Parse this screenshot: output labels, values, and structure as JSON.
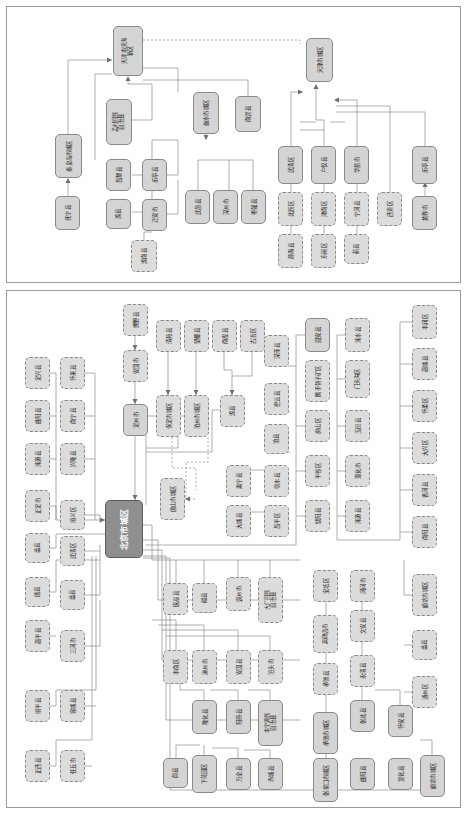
{
  "diagram": {
    "type": "hierarchy-flowchart",
    "orientation": "text-rotated-90deg",
    "panels": [
      {
        "id": "panel-top",
        "name": "tianjin-qinhuangdao-panel"
      },
      {
        "id": "panel-bottom",
        "name": "beijing-hebei-panel"
      }
    ],
    "legend": {
      "solid_node": "地级市/市辖区节点",
      "dashed_node": "县级节点",
      "root_node": "核心城区节点"
    },
    "colors": {
      "node_fill": "#d9d9d9",
      "node_border": "#8a8a8a",
      "root_fill": "#8f8f8f",
      "root_text": "#ffffff",
      "wire": "#8d8d8d",
      "panel_border": "#9a9a9a"
    }
  },
  "nodes_top": [
    {
      "id": "t1",
      "label": "天津市滨海新区",
      "style": "solid",
      "x": 113,
      "y": 26,
      "w": 30,
      "h": 50
    },
    {
      "id": "t2",
      "label": "天津市城区",
      "style": "solid",
      "x": 306,
      "y": 38,
      "w": 27,
      "h": 44
    },
    {
      "id": "t3",
      "label": "秦皇岛市城区",
      "style": "solid",
      "x": 55,
      "y": 134,
      "w": 27,
      "h": 44
    },
    {
      "id": "t4",
      "label": "抚宁县",
      "style": "solid",
      "x": 55,
      "y": 196,
      "w": 25,
      "h": 34
    },
    {
      "id": "t5",
      "label": "孟村回族自治县",
      "style": "solid",
      "x": 106,
      "y": 99,
      "w": 26,
      "h": 46
    },
    {
      "id": "t6",
      "label": "昌黎县",
      "style": "solid",
      "x": 106,
      "y": 159,
      "w": 25,
      "h": 32
    },
    {
      "id": "t7",
      "label": "滦县",
      "style": "solid",
      "x": 106,
      "y": 199,
      "w": 25,
      "h": 30
    },
    {
      "id": "t8",
      "label": "乐亭县",
      "style": "solid",
      "x": 142,
      "y": 159,
      "w": 25,
      "h": 32
    },
    {
      "id": "t9",
      "label": "迁安市",
      "style": "solid",
      "x": 142,
      "y": 199,
      "w": 25,
      "h": 32
    },
    {
      "id": "t10",
      "label": "滦南县",
      "style": "dashed",
      "x": 131,
      "y": 240,
      "w": 26,
      "h": 32
    },
    {
      "id": "t11",
      "label": "衡水市城区",
      "style": "solid",
      "x": 193,
      "y": 92,
      "w": 26,
      "h": 42
    },
    {
      "id": "t12",
      "label": "南宫县",
      "style": "solid",
      "x": 235,
      "y": 96,
      "w": 26,
      "h": 36
    },
    {
      "id": "t13",
      "label": "武邑县",
      "style": "solid",
      "x": 185,
      "y": 190,
      "w": 25,
      "h": 34
    },
    {
      "id": "t14",
      "label": "深州市",
      "style": "solid",
      "x": 213,
      "y": 190,
      "w": 25,
      "h": 34
    },
    {
      "id": "t15",
      "label": "枣强县",
      "style": "solid",
      "x": 241,
      "y": 190,
      "w": 25,
      "h": 34
    },
    {
      "id": "t16",
      "label": "武清区",
      "style": "solid",
      "x": 278,
      "y": 146,
      "w": 25,
      "h": 38
    },
    {
      "id": "t17",
      "label": "北辰区",
      "style": "dashed",
      "x": 278,
      "y": 192,
      "w": 25,
      "h": 34
    },
    {
      "id": "t18",
      "label": "静海县",
      "style": "dashed",
      "x": 278,
      "y": 234,
      "w": 25,
      "h": 34
    },
    {
      "id": "t19",
      "label": "户仅县",
      "style": "solid",
      "x": 311,
      "y": 146,
      "w": 25,
      "h": 38
    },
    {
      "id": "t20",
      "label": "津南区",
      "style": "dashed",
      "x": 311,
      "y": 192,
      "w": 25,
      "h": 34
    },
    {
      "id": "t21",
      "label": "东丽区",
      "style": "dashed",
      "x": 311,
      "y": 234,
      "w": 25,
      "h": 34
    },
    {
      "id": "t22",
      "label": "华苗市",
      "style": "solid",
      "x": 344,
      "y": 146,
      "w": 25,
      "h": 38
    },
    {
      "id": "t23",
      "label": "宁河县",
      "style": "dashed",
      "x": 344,
      "y": 192,
      "w": 25,
      "h": 34
    },
    {
      "id": "t24",
      "label": "蓟县",
      "style": "dashed",
      "x": 344,
      "y": 234,
      "w": 25,
      "h": 30
    },
    {
      "id": "t25",
      "label": "西青区",
      "style": "dashed",
      "x": 377,
      "y": 192,
      "w": 25,
      "h": 34
    },
    {
      "id": "t26",
      "label": "乐亭县",
      "style": "solid",
      "x": 412,
      "y": 146,
      "w": 25,
      "h": 38
    },
    {
      "id": "t27",
      "label": "黄骅市",
      "style": "solid",
      "x": 412,
      "y": 196,
      "w": 25,
      "h": 34
    }
  ],
  "nodes_bottom": [
    {
      "id": "b0",
      "label": "北京市城区",
      "style": "root",
      "x": 105,
      "y": 500,
      "w": 38,
      "h": 58
    },
    {
      "id": "b1",
      "label": "博野县",
      "style": "dashed",
      "x": 123,
      "y": 304,
      "w": 25,
      "h": 32
    },
    {
      "id": "b2",
      "label": "安国市",
      "style": "dashed",
      "x": 123,
      "y": 350,
      "w": 25,
      "h": 32
    },
    {
      "id": "b3",
      "label": "定州市",
      "style": "solid",
      "x": 123,
      "y": 404,
      "w": 25,
      "h": 32
    },
    {
      "id": "b4",
      "label": "清苑县",
      "style": "dashed",
      "x": 156,
      "y": 320,
      "w": 25,
      "h": 32
    },
    {
      "id": "b5",
      "label": "望都县",
      "style": "dashed",
      "x": 184,
      "y": 320,
      "w": 25,
      "h": 32
    },
    {
      "id": "b6",
      "label": "南皮县",
      "style": "dashed",
      "x": 212,
      "y": 320,
      "w": 25,
      "h": 32
    },
    {
      "id": "b7",
      "label": "古冶区",
      "style": "dashed",
      "x": 240,
      "y": 320,
      "w": 25,
      "h": 32
    },
    {
      "id": "b8",
      "label": "保定市城区",
      "style": "dashed",
      "x": 156,
      "y": 395,
      "w": 25,
      "h": 42
    },
    {
      "id": "b9",
      "label": "沧州市城区",
      "style": "dashed",
      "x": 184,
      "y": 395,
      "w": 25,
      "h": 42
    },
    {
      "id": "b10",
      "label": "滦县",
      "style": "dashed",
      "x": 220,
      "y": 395,
      "w": 25,
      "h": 32
    },
    {
      "id": "b11",
      "label": "唐山市城区",
      "style": "dashed",
      "x": 160,
      "y": 478,
      "w": 25,
      "h": 42
    },
    {
      "id": "b12",
      "label": "定兴县",
      "style": "dashed",
      "x": 25,
      "y": 357,
      "w": 25,
      "h": 32
    },
    {
      "id": "b13",
      "label": "曲阳县",
      "style": "dashed",
      "x": 25,
      "y": 400,
      "w": 25,
      "h": 32
    },
    {
      "id": "b14",
      "label": "涞源县",
      "style": "dashed",
      "x": 25,
      "y": 443,
      "w": 25,
      "h": 32
    },
    {
      "id": "b15",
      "label": "正定市",
      "style": "dashed",
      "x": 25,
      "y": 490,
      "w": 25,
      "h": 32
    },
    {
      "id": "b16",
      "label": "蠡县",
      "style": "dashed",
      "x": 25,
      "y": 533,
      "w": 25,
      "h": 30
    },
    {
      "id": "b17",
      "label": "唐县",
      "style": "dashed",
      "x": 25,
      "y": 577,
      "w": 25,
      "h": 30
    },
    {
      "id": "b18",
      "label": "藁平县",
      "style": "dashed",
      "x": 25,
      "y": 620,
      "w": 25,
      "h": 32
    },
    {
      "id": "b19",
      "label": "顺平县",
      "style": "dashed",
      "x": 25,
      "y": 690,
      "w": 25,
      "h": 32
    },
    {
      "id": "b20",
      "label": "正西县",
      "style": "dashed",
      "x": 25,
      "y": 750,
      "w": 25,
      "h": 32
    },
    {
      "id": "b21",
      "label": "怀来县",
      "style": "dashed",
      "x": 60,
      "y": 357,
      "w": 25,
      "h": 32
    },
    {
      "id": "b22",
      "label": "南宁县",
      "style": "dashed",
      "x": 60,
      "y": 400,
      "w": 25,
      "h": 32
    },
    {
      "id": "b23",
      "label": "兴隆县",
      "style": "dashed",
      "x": 60,
      "y": 443,
      "w": 25,
      "h": 32
    },
    {
      "id": "b24",
      "label": "顺义区",
      "style": "dashed",
      "x": 60,
      "y": 500,
      "w": 25,
      "h": 30
    },
    {
      "id": "b25",
      "label": "武清区",
      "style": "dashed",
      "x": 60,
      "y": 536,
      "w": 25,
      "h": 30
    },
    {
      "id": "b26",
      "label": "蠡县",
      "style": "dashed",
      "x": 60,
      "y": 580,
      "w": 25,
      "h": 30
    },
    {
      "id": "b27",
      "label": "三河市",
      "style": "dashed",
      "x": 60,
      "y": 630,
      "w": 25,
      "h": 32
    },
    {
      "id": "b28",
      "label": "容城县",
      "style": "dashed",
      "x": 60,
      "y": 690,
      "w": 25,
      "h": 32
    },
    {
      "id": "b29",
      "label": "任丘市",
      "style": "dashed",
      "x": 60,
      "y": 750,
      "w": 25,
      "h": 32
    },
    {
      "id": "b30",
      "label": "深泽县",
      "style": "dashed",
      "x": 264,
      "y": 335,
      "w": 25,
      "h": 32
    },
    {
      "id": "b31",
      "label": "密云县",
      "style": "dashed",
      "x": 264,
      "y": 383,
      "w": 25,
      "h": 32
    },
    {
      "id": "b32",
      "label": "沧县",
      "style": "dashed",
      "x": 264,
      "y": 424,
      "w": 25,
      "h": 30
    },
    {
      "id": "b33",
      "label": "肃宁县",
      "style": "dashed",
      "x": 226,
      "y": 465,
      "w": 25,
      "h": 32
    },
    {
      "id": "b34",
      "label": "大城县",
      "style": "dashed",
      "x": 226,
      "y": 505,
      "w": 25,
      "h": 32
    },
    {
      "id": "b35",
      "label": "徐水县",
      "style": "dashed",
      "x": 264,
      "y": 465,
      "w": 25,
      "h": 32
    },
    {
      "id": "b36",
      "label": "昌平区",
      "style": "dashed",
      "x": 264,
      "y": 505,
      "w": 25,
      "h": 32
    },
    {
      "id": "b37",
      "label": "固安县",
      "style": "solid",
      "x": 305,
      "y": 318,
      "w": 25,
      "h": 34
    },
    {
      "id": "b38",
      "label": "鹰手营子矿区",
      "style": "dashed",
      "x": 305,
      "y": 360,
      "w": 25,
      "h": 42
    },
    {
      "id": "b39",
      "label": "房山区",
      "style": "dashed",
      "x": 305,
      "y": 410,
      "w": 25,
      "h": 32
    },
    {
      "id": "b40",
      "label": "平谷区",
      "style": "dashed",
      "x": 305,
      "y": 455,
      "w": 25,
      "h": 32
    },
    {
      "id": "b41",
      "label": "饶阳县",
      "style": "dashed",
      "x": 305,
      "y": 500,
      "w": 25,
      "h": 32
    },
    {
      "id": "b42",
      "label": "涞水县",
      "style": "dashed",
      "x": 345,
      "y": 318,
      "w": 25,
      "h": 34
    },
    {
      "id": "b43",
      "label": "门头沟区",
      "style": "dashed",
      "x": 345,
      "y": 360,
      "w": 25,
      "h": 38
    },
    {
      "id": "b44",
      "label": "玉田县",
      "style": "dashed",
      "x": 345,
      "y": 410,
      "w": 25,
      "h": 32
    },
    {
      "id": "b45",
      "label": "遵化市",
      "style": "dashed",
      "x": 345,
      "y": 455,
      "w": 25,
      "h": 32
    },
    {
      "id": "b46",
      "label": "涞源县",
      "style": "dashed",
      "x": 345,
      "y": 500,
      "w": 25,
      "h": 32
    },
    {
      "id": "b47",
      "label": "丰润区",
      "style": "dashed",
      "x": 412,
      "y": 305,
      "w": 25,
      "h": 34
    },
    {
      "id": "b48",
      "label": "藁城县",
      "style": "dashed",
      "x": 412,
      "y": 348,
      "w": 25,
      "h": 32
    },
    {
      "id": "b49",
      "label": "怀柔区",
      "style": "dashed",
      "x": 412,
      "y": 390,
      "w": 25,
      "h": 32
    },
    {
      "id": "b50",
      "label": "大兴区",
      "style": "dashed",
      "x": 412,
      "y": 432,
      "w": 25,
      "h": 32
    },
    {
      "id": "b51",
      "label": "香河县",
      "style": "dashed",
      "x": 412,
      "y": 474,
      "w": 25,
      "h": 32
    },
    {
      "id": "b52",
      "label": "南阳县",
      "style": "dashed",
      "x": 412,
      "y": 516,
      "w": 25,
      "h": 32
    },
    {
      "id": "b53",
      "label": "廊坊市城区",
      "style": "dashed",
      "x": 412,
      "y": 574,
      "w": 25,
      "h": 42
    },
    {
      "id": "b54",
      "label": "蠡县",
      "style": "dashed",
      "x": 412,
      "y": 630,
      "w": 25,
      "h": 30
    },
    {
      "id": "b55",
      "label": "通州区",
      "style": "dashed",
      "x": 412,
      "y": 676,
      "w": 25,
      "h": 32
    },
    {
      "id": "b56",
      "label": "宝坻区",
      "style": "dashed",
      "x": 313,
      "y": 570,
      "w": 25,
      "h": 32
    },
    {
      "id": "b57",
      "label": "高碑店市",
      "style": "dashed",
      "x": 313,
      "y": 615,
      "w": 25,
      "h": 38
    },
    {
      "id": "b58",
      "label": "承德县",
      "style": "dashed",
      "x": 313,
      "y": 663,
      "w": 25,
      "h": 32
    },
    {
      "id": "b59",
      "label": "承德市城区",
      "style": "solid",
      "x": 313,
      "y": 712,
      "w": 25,
      "h": 42
    },
    {
      "id": "b60",
      "label": "河间市",
      "style": "dashed",
      "x": 350,
      "y": 570,
      "w": 25,
      "h": 32
    },
    {
      "id": "b61",
      "label": "文安县",
      "style": "dashed",
      "x": 350,
      "y": 610,
      "w": 25,
      "h": 32
    },
    {
      "id": "b62",
      "label": "永清县",
      "style": "dashed",
      "x": 350,
      "y": 655,
      "w": 25,
      "h": 32
    },
    {
      "id": "b63",
      "label": "张北县",
      "style": "solid",
      "x": 350,
      "y": 700,
      "w": 25,
      "h": 32
    },
    {
      "id": "b64",
      "label": "怀安县",
      "style": "solid",
      "x": 388,
      "y": 705,
      "w": 25,
      "h": 32
    },
    {
      "id": "b65",
      "label": "医巫县",
      "style": "dashed",
      "x": 163,
      "y": 583,
      "w": 25,
      "h": 32
    },
    {
      "id": "b66",
      "label": "献县",
      "style": "dashed",
      "x": 192,
      "y": 583,
      "w": 25,
      "h": 30
    },
    {
      "id": "b67",
      "label": "霸州市",
      "style": "dashed",
      "x": 226,
      "y": 577,
      "w": 25,
      "h": 34
    },
    {
      "id": "b68",
      "label": "大厂回族自治县",
      "style": "dashed",
      "x": 258,
      "y": 577,
      "w": 25,
      "h": 46
    },
    {
      "id": "b69",
      "label": "丰南区",
      "style": "dashed",
      "x": 163,
      "y": 650,
      "w": 25,
      "h": 34
    },
    {
      "id": "b70",
      "label": "涿州市",
      "style": "dashed",
      "x": 192,
      "y": 650,
      "w": 25,
      "h": 34
    },
    {
      "id": "b71",
      "label": "安国县",
      "style": "dashed",
      "x": 226,
      "y": 650,
      "w": 25,
      "h": 34
    },
    {
      "id": "b72",
      "label": "泊头市",
      "style": "dashed",
      "x": 258,
      "y": 650,
      "w": 25,
      "h": 34
    },
    {
      "id": "b73",
      "label": "隆化县",
      "style": "solid",
      "x": 192,
      "y": 700,
      "w": 25,
      "h": 34
    },
    {
      "id": "b74",
      "label": "阳原县",
      "style": "solid",
      "x": 226,
      "y": 700,
      "w": 25,
      "h": 34
    },
    {
      "id": "b75",
      "label": "丰宁满族自治县",
      "style": "solid",
      "x": 258,
      "y": 700,
      "w": 25,
      "h": 46
    },
    {
      "id": "b76",
      "label": "蔚县",
      "style": "solid",
      "x": 163,
      "y": 758,
      "w": 25,
      "h": 30
    },
    {
      "id": "b77",
      "label": "下花园区",
      "style": "solid",
      "x": 192,
      "y": 755,
      "w": 25,
      "h": 38
    },
    {
      "id": "b78",
      "label": "万全县",
      "style": "solid",
      "x": 226,
      "y": 758,
      "w": 25,
      "h": 32
    },
    {
      "id": "b79",
      "label": "赤城县",
      "style": "solid",
      "x": 258,
      "y": 758,
      "w": 25,
      "h": 32
    },
    {
      "id": "b80",
      "label": "张家口市城区",
      "style": "solid",
      "x": 313,
      "y": 758,
      "w": 25,
      "h": 44
    },
    {
      "id": "b81",
      "label": "曲阳县",
      "style": "solid",
      "x": 350,
      "y": 758,
      "w": 25,
      "h": 32
    },
    {
      "id": "b82",
      "label": "宣化县",
      "style": "solid",
      "x": 388,
      "y": 758,
      "w": 25,
      "h": 32
    },
    {
      "id": "b83",
      "label": "廊坊市城区",
      "style": "solid",
      "x": 420,
      "y": 755,
      "w": 25,
      "h": 42
    }
  ]
}
